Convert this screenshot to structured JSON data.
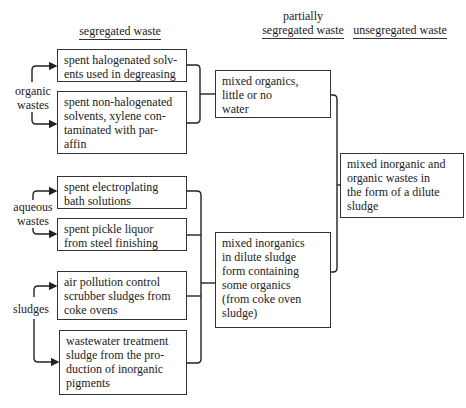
{
  "headers": {
    "segregated": "segregated waste",
    "partially_line1": "partially",
    "partially_line2": "segregated waste",
    "unsegregated": "unsegregated waste"
  },
  "side_labels": {
    "organic": [
      "organic",
      "wastes"
    ],
    "aqueous": [
      "aqueous",
      "wastes"
    ],
    "sludges": [
      "sludges"
    ]
  },
  "segregated_boxes": [
    {
      "lines": [
        "spent halogenated solv-",
        "ents used in degreasing"
      ]
    },
    {
      "lines": [
        "spent non-halogenated",
        "solvents, xylene con-",
        "taminated with par-",
        "affin"
      ]
    },
    {
      "lines": [
        "spent electroplating",
        "bath solutions"
      ]
    },
    {
      "lines": [
        "spent pickle liquor",
        "from steel finishing"
      ]
    },
    {
      "lines": [
        "air pollution control",
        "scrubber sludges from",
        "coke ovens"
      ]
    },
    {
      "lines": [
        "wastewater treatment",
        "sludge from the pro-",
        "duction of inorganic",
        "pigments"
      ]
    }
  ],
  "partially_segregated_boxes": [
    {
      "lines": [
        "mixed organics,",
        "little or no",
        "water"
      ]
    },
    {
      "lines": [
        "mixed inorganics",
        "in dilute sludge",
        "form containing",
        "some organics",
        "(from coke oven",
        "sludge)"
      ]
    }
  ],
  "unsegregated_box": {
    "lines": [
      "mixed inorganic and",
      "organic wastes in",
      "the form of a dilute",
      "sludge"
    ]
  }
}
